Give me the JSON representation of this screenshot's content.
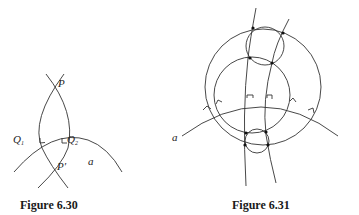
{
  "figures": [
    {
      "id": "fig-6-30",
      "caption": "Figure 6.30",
      "labels": {
        "P": "P",
        "P_prime": "P′",
        "Q1_base": "Q",
        "Q1_sub": "1",
        "Q2_base": "Q",
        "Q2_sub": "2",
        "a": "a"
      },
      "description": "Two arcs through P and P′ each meeting circle-arc a orthogonally at Q1 and Q2 (right-angle marks)."
    },
    {
      "id": "fig-6-31",
      "caption": "Figure 6.31",
      "labels": {
        "a": "a"
      },
      "description": "Two concentric-like circles crossed by two curves orthogonal to arc a, with small circles through intersection points; six right-angle marks on a."
    }
  ],
  "colors": {
    "stroke": "#333333",
    "background": "#ffffff",
    "text": "#222222"
  }
}
